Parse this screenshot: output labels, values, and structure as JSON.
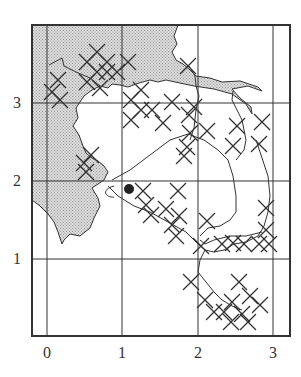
{
  "figure": {
    "type": "grid-map",
    "x_ticks": [
      {
        "label": "0",
        "px": 47
      },
      {
        "label": "1",
        "px": 122
      },
      {
        "label": "2",
        "px": 198
      },
      {
        "label": "3",
        "px": 273
      }
    ],
    "y_ticks": [
      {
        "label": "3",
        "px": 103
      },
      {
        "label": "2",
        "px": 181
      },
      {
        "label": "1",
        "px": 259
      }
    ],
    "frame": {
      "left": 32,
      "top": 25,
      "right": 290,
      "bottom": 336
    },
    "colors": {
      "land_fill": "#c8c8c8",
      "line": "#333333",
      "marker": "#222222"
    },
    "marker": {
      "symbol": "filled-circle",
      "x": 129,
      "y": 189,
      "r": 5
    },
    "cross_marker": "x",
    "crosses": [
      [
        87,
        62
      ],
      [
        97,
        72
      ],
      [
        107,
        62
      ],
      [
        117,
        72
      ],
      [
        97,
        52
      ],
      [
        107,
        72
      ],
      [
        128,
        62
      ],
      [
        87,
        82
      ],
      [
        100,
        88
      ],
      [
        52,
        92
      ],
      [
        60,
        100
      ],
      [
        58,
        80
      ],
      [
        131,
        100
      ],
      [
        141,
        110
      ],
      [
        131,
        120
      ],
      [
        141,
        90
      ],
      [
        163,
        123
      ],
      [
        152,
        110
      ],
      [
        91,
        155
      ],
      [
        86,
        172
      ],
      [
        84,
        163
      ],
      [
        188,
        66
      ],
      [
        172,
        102
      ],
      [
        190,
        133
      ],
      [
        187,
        147
      ],
      [
        184,
        156
      ],
      [
        194,
        107
      ],
      [
        189,
        115
      ],
      [
        237,
        126
      ],
      [
        262,
        122
      ],
      [
        259,
        144
      ],
      [
        207,
        131
      ],
      [
        233,
        146
      ],
      [
        143,
        191
      ],
      [
        146,
        205
      ],
      [
        178,
        191
      ],
      [
        151,
        215
      ],
      [
        166,
        209
      ],
      [
        172,
        225
      ],
      [
        176,
        236
      ],
      [
        179,
        216
      ],
      [
        207,
        221
      ],
      [
        201,
        246
      ],
      [
        266,
        208
      ],
      [
        266,
        230
      ],
      [
        269,
        244
      ],
      [
        259,
        244
      ],
      [
        244,
        244
      ],
      [
        233,
        243
      ],
      [
        222,
        244
      ],
      [
        191,
        282
      ],
      [
        205,
        300
      ],
      [
        214,
        312
      ],
      [
        224,
        312
      ],
      [
        232,
        302
      ],
      [
        242,
        314
      ],
      [
        239,
        282
      ],
      [
        250,
        296
      ],
      [
        260,
        305
      ],
      [
        231,
        322
      ],
      [
        248,
        322
      ]
    ],
    "land_paths": [
      "M32,25 L178,25 L174,36 L177,44 L172,52 L176,60 L183,64 L190,70 L196,76 L210,78 L222,82 L240,81 L258,87 L262,91 L248,86 L232,89 L240,98 L251,107 L252,114 L246,104 L232,94 L214,89 L194,86 L175,82 L166,80 L158,82 L150,80 L139,83 L128,87 L120,85 L112,84 L108,88 L100,86 L92,90 L84,96 L76,108 L78,118 L73,126 L79,135 L83,146 L86,153 L92,158 L98,161 L104,166 L108,172 L104,180 L98,184 L92,188 L98,198 L100,206 L94,218 L90,228 L80,236 L70,234 L64,240 L62,244 L58,232 L54,222 L48,214 L40,206 L32,200 Z"
    ],
    "coast_lines": [
      "M32,200 L40,206 L48,214 L54,222 L58,232 L62,244 L64,240 L70,234 L80,236 L90,228 L94,218 L100,206 L98,198 L92,188 L98,184 L104,180 L108,172 L104,166 L98,161 L92,158 L86,153 L83,146 L79,135 L73,126 L78,118 L76,108 L84,96 L92,90 L100,86 L108,88 L112,84 L120,85 L128,87 L139,83 L150,80 L158,82 L166,80 L175,82 L194,86 L214,89 L232,94 L246,104 L252,114",
      "M178,25 L174,36 L177,44 L172,52 L176,60 L183,64 L190,70 L196,76 L210,78 L222,82 L240,81 L258,87 L262,91 L248,86 L232,89 L240,98 L251,107 L252,114",
      "M49,65 L62,58 L64,66 L76,72 L90,78 L100,86",
      "M112,180 L130,170 L150,155 L170,140 L188,134 L204,140 L218,150 L228,160 L233,176 L236,196 L236,212 L230,220 L220,226 L208,228 L200,236",
      "M189,66 L195,76 L196,86 L199,96 L196,110 L194,128 L190,140",
      "M233,91 L232,100 L236,108 L242,120 L246,140 L244,150 L236,160",
      "M108,186 L118,196 L134,206 L150,212 L168,222 L186,232 L198,244 L205,250 L200,260 L198,272 L206,282 L214,292 L222,300 L232,306 L242,310",
      "M205,250 L214,252 L224,250 L234,244 L246,242 L258,236 L264,226 L268,212 L270,196 L268,176 L262,158 L256,140",
      "M200,240 L205,244 L214,240 L230,236 L246,236 L262,232",
      "M114,186 C100,190 106,198 114,197"
    ]
  }
}
